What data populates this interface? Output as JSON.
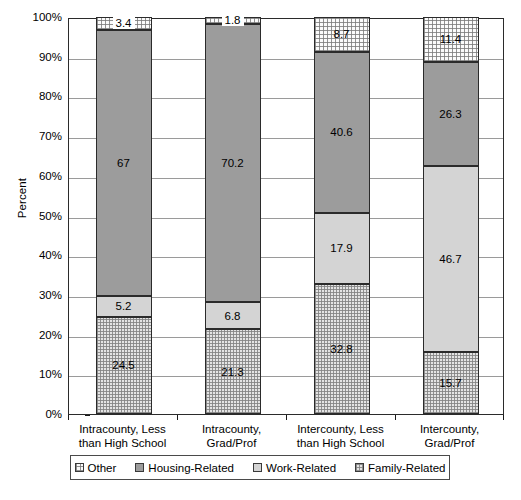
{
  "chart_data": {
    "type": "bar",
    "subtype": "stacked-100-percent",
    "title": "",
    "subtitle": "",
    "xlabel": "",
    "ylabel": "Percent",
    "ylim": [
      0,
      100
    ],
    "grid": "horizontal",
    "legend_position": "bottom",
    "categories": [
      "Intracounty, Less than High School",
      "Intracounty, Grad/Prof",
      "Intercounty, Less than High School",
      "Intercounty, Grad/Prof"
    ],
    "category_lines": [
      [
        "Intracounty, Less",
        "than High School"
      ],
      [
        "Intracounty,",
        "Grad/Prof"
      ],
      [
        "Intercounty, Less",
        "than High School"
      ],
      [
        "Intercounty,",
        "Grad/Prof"
      ]
    ],
    "stack_order_bottom_to_top": [
      "Family-Related",
      "Work-Related",
      "Housing-Related",
      "Other"
    ],
    "series": [
      {
        "name": "Family-Related",
        "color": "#e4e4e4",
        "pattern": "stipple-checker",
        "values": [
          24.5,
          21.3,
          32.8,
          15.7
        ],
        "labels": [
          "24.5",
          "21.3",
          "32.8",
          "15.7"
        ]
      },
      {
        "name": "Work-Related",
        "color": "#d4d4d4",
        "pattern": "solid-light-gray",
        "values": [
          5.2,
          6.8,
          17.9,
          46.7
        ],
        "labels": [
          "5.2",
          "6.8",
          "17.9",
          "46.7"
        ]
      },
      {
        "name": "Housing-Related",
        "color": "#9c9c9c",
        "pattern": "solid-medium-gray",
        "values": [
          67,
          70.2,
          40.6,
          26.3
        ],
        "labels": [
          "67",
          "70.2",
          "40.6",
          "26.3"
        ]
      },
      {
        "name": "Other",
        "color": "#fbfbfb",
        "pattern": "fine-dots",
        "values": [
          3.4,
          1.8,
          8.7,
          11.4
        ],
        "labels": [
          "3.4",
          "1.8",
          "8.7",
          "11.4"
        ]
      }
    ],
    "y_ticks": [
      {
        "value": 0,
        "label": "0%"
      },
      {
        "value": 10,
        "label": "10%"
      },
      {
        "value": 20,
        "label": "20%"
      },
      {
        "value": 30,
        "label": "30%"
      },
      {
        "value": 40,
        "label": "40%"
      },
      {
        "value": 50,
        "label": "50%"
      },
      {
        "value": 60,
        "label": "60%"
      },
      {
        "value": 70,
        "label": "70%"
      },
      {
        "value": 80,
        "label": "80%"
      },
      {
        "value": 90,
        "label": "90%"
      },
      {
        "value": 100,
        "label": "100%"
      }
    ]
  },
  "legend": {
    "items": [
      {
        "label": "Other",
        "swatch": "swatch-other"
      },
      {
        "label": "Housing-Related",
        "swatch": "swatch-housing"
      },
      {
        "label": "Work-Related",
        "swatch": "swatch-work"
      },
      {
        "label": "Family-Related",
        "swatch": "swatch-family"
      }
    ]
  },
  "caption": ""
}
